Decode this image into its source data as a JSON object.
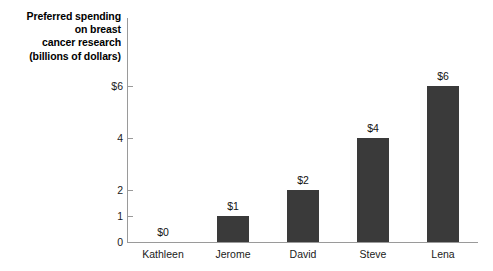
{
  "chart_data": {
    "type": "bar",
    "title": "Preferred spending on breast cancer research (billions of dollars)",
    "title_lines": [
      "Preferred spending",
      "on breast",
      "cancer research",
      "(billions of dollars)"
    ],
    "categories": [
      "Kathleen",
      "Jerome",
      "David",
      "Steve",
      "Lena"
    ],
    "values": [
      0,
      1,
      2,
      4,
      6
    ],
    "value_labels": [
      "$0",
      "$1",
      "$2",
      "$4",
      "$6"
    ],
    "xlabel": "",
    "ylabel": "Preferred spending on breast cancer research (billions of dollars)",
    "ylim": [
      0,
      6.5
    ],
    "yticks": [
      6,
      4,
      2,
      1,
      0
    ],
    "ytick_labels": [
      "$6",
      "4",
      "2",
      "1",
      "0"
    ],
    "grid": false,
    "legend": false,
    "bar_color": "#3a3a3a",
    "axis_color": "#9a9a9a",
    "background_color": "#ffffff"
  }
}
